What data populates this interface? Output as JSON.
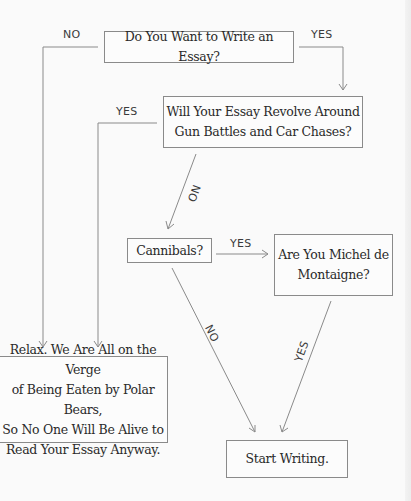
{
  "diagram": {
    "type": "flowchart",
    "nodes": {
      "q1": {
        "text": "Do You Want to Write an Essay?"
      },
      "q2": {
        "line1": "Will Your Essay Revolve Around",
        "line2": "Gun Battles and Car Chases?"
      },
      "q3": {
        "text": "Cannibals?"
      },
      "q4": {
        "line1": "Are You Michel de",
        "line2": "Montaigne?"
      },
      "relax": {
        "line1": "Relax. We Are All on the Verge",
        "line2": "of Being Eaten by Polar Bears,",
        "line3": "So No One Will Be Alive to",
        "line4": "Read Your Essay Anyway."
      },
      "start": {
        "text": "Start Writing."
      }
    },
    "edges": [
      {
        "from": "q1",
        "to": "relax",
        "label": "NO"
      },
      {
        "from": "q1",
        "to": "q2",
        "label": "YES"
      },
      {
        "from": "q2",
        "to": "relax",
        "label": "YES"
      },
      {
        "from": "q2",
        "to": "q3",
        "label": "NO"
      },
      {
        "from": "q3",
        "to": "q4",
        "label": "YES"
      },
      {
        "from": "q3",
        "to": "start",
        "label": "NO"
      },
      {
        "from": "q4",
        "to": "start",
        "label": "YES"
      }
    ],
    "colors": {
      "background": "#fafafa",
      "line": "#8a8a8a",
      "text": "#2a2a2a"
    }
  }
}
